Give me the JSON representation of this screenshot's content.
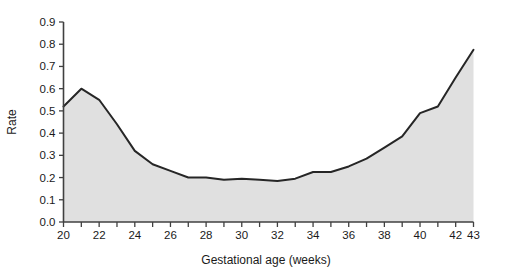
{
  "chart_data": {
    "type": "area",
    "title": "",
    "subtitle": "",
    "xlabel": "Gestational age (weeks)",
    "ylabel": "Rate",
    "xlim": [
      20,
      43
    ],
    "ylim": [
      0.0,
      0.9
    ],
    "grid": false,
    "legend": false,
    "legend_position": "none",
    "x": [
      20,
      21,
      22,
      23,
      24,
      25,
      26,
      27,
      28,
      29,
      30,
      31,
      32,
      33,
      34,
      35,
      36,
      37,
      38,
      39,
      40,
      41,
      42,
      43
    ],
    "values": [
      0.52,
      0.6,
      0.55,
      0.44,
      0.32,
      0.26,
      0.23,
      0.2,
      0.2,
      0.19,
      0.195,
      0.19,
      0.185,
      0.195,
      0.225,
      0.225,
      0.25,
      0.285,
      0.335,
      0.385,
      0.49,
      0.52,
      0.65,
      0.775
    ],
    "series": [
      {
        "name": "Rate",
        "values": [
          0.52,
          0.6,
          0.55,
          0.44,
          0.32,
          0.26,
          0.23,
          0.2,
          0.2,
          0.19,
          0.195,
          0.19,
          0.185,
          0.195,
          0.225,
          0.225,
          0.25,
          0.285,
          0.335,
          0.385,
          0.49,
          0.52,
          0.65,
          0.775
        ],
        "line_color": "#262626",
        "fill_color": "#e0e0e0"
      }
    ],
    "x_tick_labels": [
      "20",
      "22",
      "24",
      "26",
      "28",
      "30",
      "32",
      "34",
      "36",
      "38",
      "40",
      "42",
      "43"
    ],
    "x_tick_values": [
      20,
      22,
      24,
      26,
      28,
      30,
      32,
      34,
      36,
      38,
      40,
      42,
      43
    ],
    "x_minor_ticks": [
      20,
      21,
      22,
      23,
      24,
      25,
      26,
      27,
      28,
      29,
      30,
      31,
      32,
      33,
      34,
      35,
      36,
      37,
      38,
      39,
      40,
      41,
      42,
      43
    ],
    "y_tick_labels": [
      "0.0",
      "0.1",
      "0.2",
      "0.3",
      "0.4",
      "0.5",
      "0.6",
      "0.7",
      "0.8",
      "0.9"
    ],
    "y_tick_values": [
      0.0,
      0.1,
      0.2,
      0.3,
      0.4,
      0.5,
      0.6,
      0.7,
      0.8,
      0.9
    ],
    "colors": {
      "background": "#ffffff",
      "axis": "#404040",
      "line": "#262626",
      "area_fill": "#e0e0e0",
      "text": "#1a1a1a"
    }
  },
  "axes": {
    "y_axis_title": "Rate",
    "x_axis_title": "Gestational age (weeks)"
  }
}
